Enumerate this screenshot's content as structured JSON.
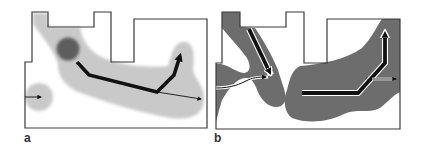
{
  "figure": {
    "panels": [
      {
        "id": "a",
        "label": "a",
        "description": "Floor plan with light-gray diffuse region, dark spot, and black path arrows"
      },
      {
        "id": "b",
        "label": "b",
        "description": "Floor plan with dark-gray region and outlined black path arrows"
      }
    ]
  },
  "colors": {
    "outline": "#3a3a3a",
    "light_region": "#c9c9c9",
    "dark_region": "#6d6d6d",
    "dark_spot": "#5a5a5a",
    "arrow": "#111111",
    "arrow_halo": "#ffffff",
    "background": "#ffffff"
  }
}
